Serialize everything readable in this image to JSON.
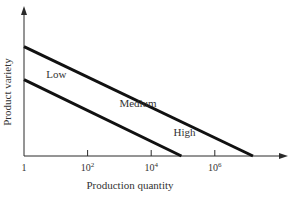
{
  "chart_data": {
    "type": "line",
    "title": "",
    "xlabel": "Production quantity",
    "ylabel": "Product variety",
    "x_scale": "log",
    "xlim_log10": [
      0,
      8.3
    ],
    "ylim": [
      0,
      1
    ],
    "grid": false,
    "x_ticks": [
      {
        "log10": 0,
        "base": "1",
        "exp": ""
      },
      {
        "log10": 2,
        "base": "10",
        "exp": "2"
      },
      {
        "log10": 4,
        "base": "10",
        "exp": "4"
      },
      {
        "log10": 6,
        "base": "10",
        "exp": "6"
      }
    ],
    "series": [
      {
        "name": "upper-boundary",
        "points": [
          {
            "log10x": 0,
            "y": 0.76
          },
          {
            "log10x": 7.2,
            "y": 0
          }
        ]
      },
      {
        "name": "lower-boundary",
        "points": [
          {
            "log10x": 0,
            "y": 0.53
          },
          {
            "log10x": 4.95,
            "y": 0
          }
        ]
      }
    ],
    "regions": [
      {
        "label": "Low",
        "log10x": 0.7,
        "y": 0.54
      },
      {
        "label": "Medium",
        "log10x": 3.0,
        "y": 0.34
      },
      {
        "label": "High",
        "log10x": 4.7,
        "y": 0.14
      }
    ]
  }
}
